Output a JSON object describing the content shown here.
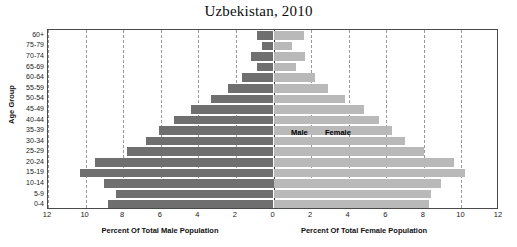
{
  "chart_data": {
    "type": "bar",
    "subtype": "population-pyramid",
    "title": "Uzbekistan, 2010",
    "categories": [
      "60+",
      "75-79",
      "70-74",
      "65-69",
      "60-64",
      "55-59",
      "50-54",
      "45-49",
      "40-44",
      "35-39",
      "30-34",
      "25-29",
      "20-24",
      "15-19",
      "10-14",
      "5-9",
      "0-4"
    ],
    "ylabel": "Age Group",
    "xlabel_left": "Percent Of Total Male Population",
    "xlabel_right": "Percent Of Total Female Population",
    "xlim": [
      -12,
      12
    ],
    "xticks": [
      "12",
      "10",
      "8",
      "6",
      "4",
      "2",
      "0",
      "2",
      "4",
      "6",
      "8",
      "10",
      "12"
    ],
    "xtick_values": [
      -12,
      -10,
      -8,
      -6,
      -4,
      -2,
      0,
      2,
      4,
      6,
      8,
      10,
      12
    ],
    "grid": true,
    "legend_position": "inside-center",
    "series": [
      {
        "name": "Male",
        "side": "left",
        "color": "#6f6f6f",
        "values": [
          0.9,
          0.6,
          1.2,
          0.9,
          1.7,
          2.4,
          3.3,
          4.4,
          5.3,
          6.1,
          6.8,
          7.8,
          9.5,
          10.3,
          9.0,
          8.4,
          8.8
        ]
      },
      {
        "name": "Female",
        "side": "right",
        "color": "#b9b9b9",
        "values": [
          1.6,
          1.0,
          1.7,
          1.2,
          2.2,
          2.9,
          3.8,
          4.8,
          5.6,
          6.3,
          7.0,
          8.0,
          9.6,
          10.2,
          8.9,
          8.4,
          8.3
        ]
      }
    ]
  }
}
